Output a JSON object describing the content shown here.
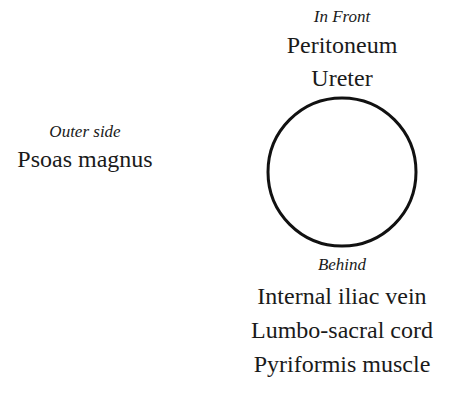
{
  "diagram": {
    "front": {
      "heading": "In Front",
      "items": [
        "Peritoneum",
        "Ureter"
      ]
    },
    "outer": {
      "heading": "Outer side",
      "items": [
        "Psoas magnus"
      ]
    },
    "behind": {
      "heading": "Behind",
      "items": [
        "Internal iliac vein",
        "Lumbo-sacral cord",
        "Pyriformis muscle"
      ]
    },
    "circle": {
      "cx": 342,
      "cy": 172,
      "r": 74,
      "stroke": "#111111"
    }
  }
}
